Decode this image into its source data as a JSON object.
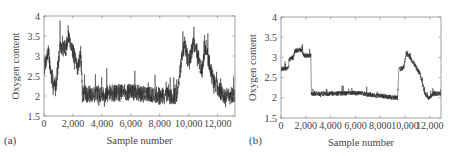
{
  "chart_data": [
    {
      "panel": "(a)",
      "type": "line",
      "title": "",
      "xlabel": "Sample number",
      "ylabel": "Oxygen content",
      "xlim": [
        0,
        13200
      ],
      "ylim": [
        1.5,
        4
      ],
      "xticks": [
        0,
        2000,
        4000,
        6000,
        8000,
        10000,
        12000
      ],
      "xtick_labels": [
        "0",
        "2,000",
        "4,000",
        "6,000",
        "8,000",
        "10,000",
        "12,000"
      ],
      "yticks": [
        1.5,
        2,
        2.5,
        3,
        3.5,
        4
      ],
      "ytick_labels": [
        "1.5",
        "2",
        "2.5",
        "3",
        "3.5",
        "4"
      ],
      "grid": false,
      "legend": null,
      "line_color": "#2b2b2b",
      "noise": 0.22,
      "spike": 0.35,
      "segments_x": [
        0,
        300,
        500,
        800,
        1100,
        1500,
        1750,
        2000,
        2300,
        2550,
        2650,
        4000,
        6000,
        8000,
        9200,
        9500,
        9700,
        10000,
        10300,
        10600,
        10900,
        11200,
        11600,
        12000,
        12500,
        13200
      ],
      "segments_y": [
        2.7,
        3.1,
        2.5,
        2.2,
        3.2,
        3.2,
        3.5,
        3.1,
        2.7,
        3.0,
        2.05,
        2.05,
        2.1,
        2.0,
        2.0,
        2.9,
        3.3,
        2.8,
        3.3,
        3.1,
        2.6,
        3.2,
        2.5,
        2.2,
        2.0,
        2.0
      ]
    },
    {
      "panel": "(b)",
      "type": "line",
      "title": "",
      "xlabel": "Sample number",
      "ylabel": "Oxygen content",
      "xlim": [
        0,
        12900
      ],
      "ylim": [
        1.5,
        4
      ],
      "xticks": [
        0,
        2000,
        4000,
        6000,
        8000,
        10000,
        12000
      ],
      "xtick_labels": [
        "0",
        "2,000",
        "4,000",
        "6,000",
        "8,000",
        "10,000",
        "12,000"
      ],
      "yticks": [
        1.5,
        2,
        2.5,
        3,
        3.5,
        4
      ],
      "ytick_labels": [
        "1.5",
        "2",
        "2.5",
        "3",
        "3.5",
        "4"
      ],
      "grid": false,
      "legend": null,
      "line_color": "#2b2b2b",
      "noise": 0.06,
      "spike": 0.12,
      "segments_x": [
        0,
        600,
        650,
        1000,
        1100,
        1500,
        1800,
        1900,
        2400,
        2450,
        2600,
        4000,
        6000,
        8000,
        9200,
        9400,
        9500,
        9900,
        10100,
        10400,
        10800,
        11200,
        11600,
        11900,
        12300,
        12900
      ],
      "segments_y": [
        2.7,
        2.75,
        2.95,
        3.0,
        3.15,
        3.2,
        3.1,
        3.05,
        3.05,
        2.1,
        2.1,
        2.1,
        2.12,
        2.05,
        2.0,
        2.0,
        2.7,
        2.75,
        3.1,
        3.0,
        2.8,
        2.6,
        2.1,
        2.0,
        2.1,
        2.1
      ]
    }
  ],
  "panels": [
    {
      "letter": "(a)"
    },
    {
      "letter": "(b)"
    }
  ]
}
